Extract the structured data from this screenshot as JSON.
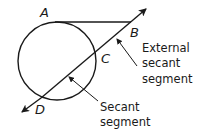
{
  "diagram": {
    "points": {
      "A": "A",
      "B": "B",
      "C": "C",
      "D": "D"
    },
    "callouts": {
      "external_secant": {
        "line1": "External",
        "line2": "secant",
        "line3": "segment"
      },
      "secant": {
        "line1": "Secant",
        "line2": "segment"
      }
    },
    "colors": {
      "stroke": "#1a1a1a",
      "background": "#ffffff"
    }
  }
}
